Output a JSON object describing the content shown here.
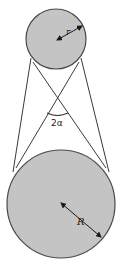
{
  "diagram": {
    "type": "two-circle tangent (crossed belt) figure",
    "colors": {
      "circle_fill": "#c4c4c4",
      "circle_stroke": "#4a4a4a",
      "line_stroke": "#3a3a3a",
      "text": "#1a1a1a",
      "background": "#ffffff"
    },
    "small_circle": {
      "label": "r"
    },
    "large_circle": {
      "label": "R"
    },
    "angle": {
      "label": "2α"
    }
  }
}
